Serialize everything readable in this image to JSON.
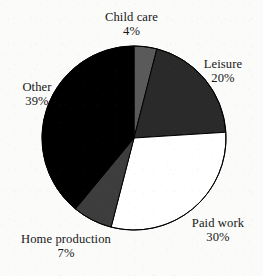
{
  "chart_data": {
    "type": "pie",
    "title": "",
    "subtitle": "",
    "xlabel": "",
    "ylabel": "",
    "legend_position": "none",
    "labels_position": "outside",
    "grid": false,
    "start_angle_deg": 0,
    "direction": "clockwise",
    "categories": [
      "Child care",
      "Leisure",
      "Paid work",
      "Home production",
      "Other"
    ],
    "values": [
      4,
      20,
      30,
      7,
      39
    ],
    "value_unit": "%",
    "slices": [
      {
        "name": "Child care",
        "value": 4,
        "value_text": "4%",
        "color": "#5a5a5a",
        "start_deg": 0,
        "end_deg": 14.4
      },
      {
        "name": "Leisure",
        "value": 20,
        "value_text": "20%",
        "color": "#2a2a2a",
        "start_deg": 14.4,
        "end_deg": 86.4
      },
      {
        "name": "Paid work",
        "value": 30,
        "value_text": "30%",
        "color": "#ffffff",
        "start_deg": 86.4,
        "end_deg": 194.4
      },
      {
        "name": "Home production",
        "value": 7,
        "value_text": "7%",
        "color": "#3d3d3d",
        "start_deg": 194.4,
        "end_deg": 219.6
      },
      {
        "name": "Other",
        "value": 39,
        "value_text": "39%",
        "color": "#000000",
        "start_deg": 219.6,
        "end_deg": 360
      }
    ],
    "geometry": {
      "center_x": 134,
      "center_y": 138,
      "radius": 92,
      "outline_color": "#000000",
      "outline_width": 1
    },
    "background_color": "#fbfbfa",
    "text_color": "#171717"
  }
}
